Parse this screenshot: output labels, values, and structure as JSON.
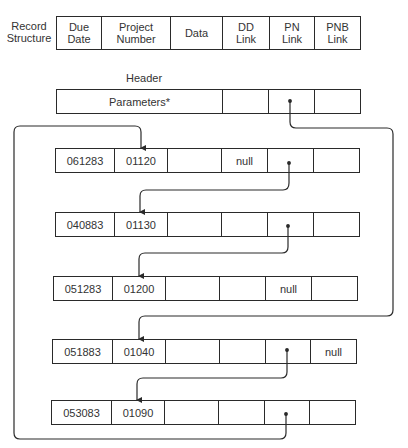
{
  "record_structure": {
    "label_line1": "Record",
    "label_line2": "Structure",
    "fields": [
      {
        "line1": "Due",
        "line2": "Date"
      },
      {
        "line1": "Project",
        "line2": "Number"
      },
      {
        "line1": "Data",
        "line2": ""
      },
      {
        "line1": "DD",
        "line2": "Link"
      },
      {
        "line1": "PN",
        "line2": "Link"
      },
      {
        "line1": "PNB",
        "line2": "Link"
      }
    ]
  },
  "header": {
    "title": "Header",
    "parameters": "Parameters*",
    "dd_link": "",
    "pn_link": "",
    "pnb_link": ""
  },
  "records": [
    {
      "due_date": "061283",
      "project_number": "01120",
      "data": "",
      "dd_link": "null",
      "pn_link": "",
      "pnb_link": ""
    },
    {
      "due_date": "040883",
      "project_number": "01130",
      "data": "",
      "dd_link": "",
      "pn_link": "",
      "pnb_link": ""
    },
    {
      "due_date": "051283",
      "project_number": "01200",
      "data": "",
      "dd_link": "",
      "pn_link": "null",
      "pnb_link": ""
    },
    {
      "due_date": "051883",
      "project_number": "01040",
      "data": "",
      "dd_link": "",
      "pn_link": "",
      "pnb_link": "null"
    },
    {
      "due_date": "053083",
      "project_number": "01090",
      "data": "",
      "dd_link": "",
      "pn_link": "",
      "pnb_link": ""
    }
  ],
  "colors": {
    "line": "#2a2a2a",
    "text": "#333333",
    "background": "#ffffff"
  }
}
